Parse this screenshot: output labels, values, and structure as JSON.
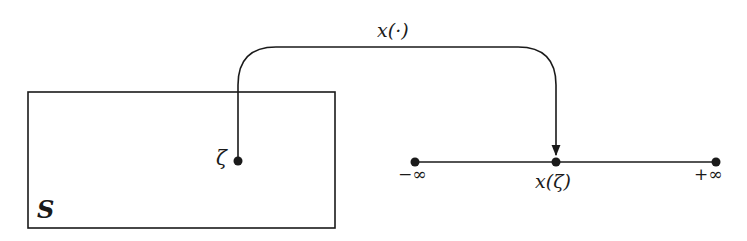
{
  "diagram": {
    "sample_space": {
      "label": "S",
      "rect": {
        "x": 28,
        "y": 92,
        "w": 307,
        "h": 136
      }
    },
    "outcome": {
      "label": "ζ",
      "point": {
        "x": 238,
        "y": 161
      }
    },
    "mapping": {
      "label": "x(·)",
      "path_top_y": 47,
      "start_x": 238,
      "end_x": 556,
      "corner_radius": 38
    },
    "real_line": {
      "y": 162,
      "left": {
        "x": 415,
        "label": "−∞"
      },
      "right": {
        "x": 716,
        "label": "+∞"
      },
      "image_point": {
        "x": 556,
        "label": "x(ζ)"
      }
    },
    "colors": {
      "ink": "#1a1a1a",
      "background": "#ffffff"
    }
  }
}
